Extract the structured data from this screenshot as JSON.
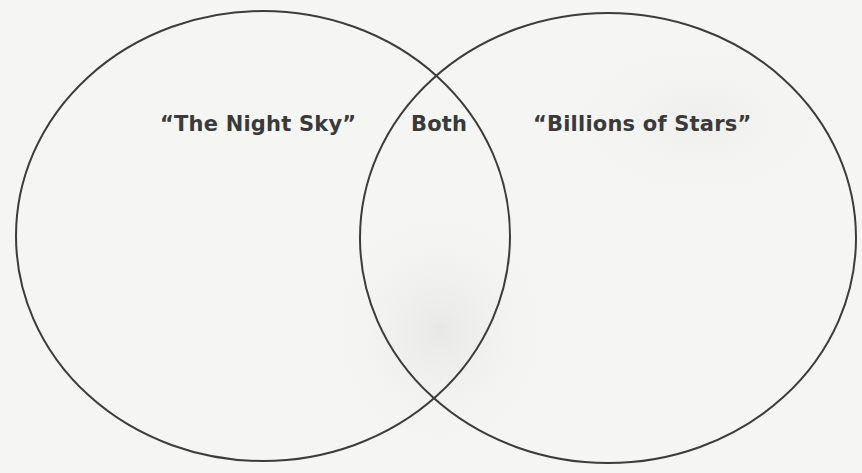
{
  "diagram": {
    "type": "venn",
    "sets": [
      {
        "id": "left",
        "label": "“The Night Sky”"
      },
      {
        "id": "right",
        "label": "“Billions of Stars”"
      }
    ],
    "intersection": {
      "label": "Both"
    }
  },
  "style": {
    "background": "#f5f5f3",
    "stroke": "#3c3c3c",
    "text": "#3a3a3a"
  }
}
